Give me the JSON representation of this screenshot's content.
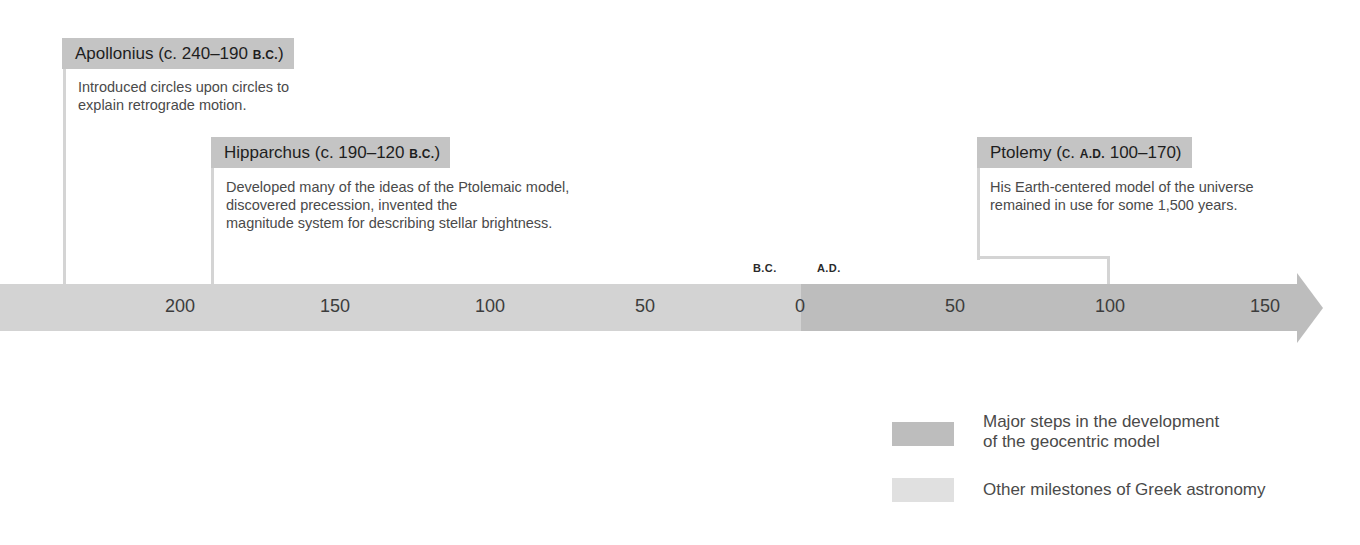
{
  "events": [
    {
      "name": "Apollonius",
      "date_prefix": "(c. 240–190 ",
      "era": "B.C.",
      "date_suffix": ")",
      "description_lines": [
        "Introduced circles upon circles to",
        "explain retrograde motion."
      ],
      "category": "other"
    },
    {
      "name": "Hipparchus",
      "date_prefix": "(c. 190–120 ",
      "era": "B.C.",
      "date_suffix": ")",
      "description_lines": [
        "Developed many of the ideas of the Ptolemaic model,",
        "discovered precession, invented the",
        "magnitude system for describing stellar brightness."
      ],
      "category": "other"
    },
    {
      "name": "Ptolemy",
      "date_prefix": "(c. ",
      "era": "A.D.",
      "date_suffix": " 100–170)",
      "description_lines": [
        "His Earth-centered model of the universe",
        "remained in use for some 1,500 years."
      ],
      "category": "major"
    }
  ],
  "timeline": {
    "era_labels": {
      "bc": "B.C.",
      "ad": "A.D."
    },
    "ticks": [
      {
        "label": "200",
        "x": 180
      },
      {
        "label": "150",
        "x": 335
      },
      {
        "label": "100",
        "x": 490
      },
      {
        "label": "50",
        "x": 645
      },
      {
        "label": "0",
        "x": 800
      },
      {
        "label": "50",
        "x": 955
      },
      {
        "label": "100",
        "x": 1110
      },
      {
        "label": "150",
        "x": 1265
      }
    ]
  },
  "legend": {
    "items": [
      {
        "label_lines": [
          "Major steps in the development",
          "of the geocentric model"
        ],
        "color": "#bdbdbd"
      },
      {
        "label_lines": [
          "Other milestones of Greek astronomy"
        ],
        "color": "#e0e0e0"
      }
    ]
  },
  "colors": {
    "header_bg": "#c4c4c4",
    "bar_bc": "#d3d3d3",
    "bar_ad": "#bdbdbd",
    "connector": "#d4d4d4"
  }
}
